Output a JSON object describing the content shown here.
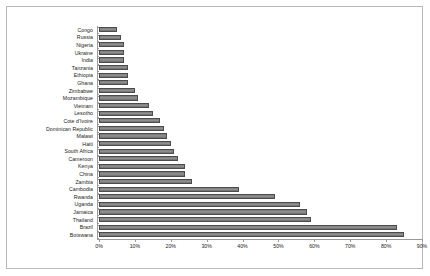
{
  "chart_data": {
    "type": "bar",
    "orientation": "horizontal",
    "title": "",
    "subtitle": "",
    "xlabel": "",
    "ylabel": "",
    "xlim": [
      0,
      90
    ],
    "ylim": null,
    "grid": false,
    "legend": null,
    "tick_suffix": "%",
    "xticks": [
      0,
      10,
      20,
      30,
      40,
      50,
      60,
      70,
      80,
      90
    ],
    "xtick_labels": [
      "0%",
      "10%",
      "20%",
      "30%",
      "40%",
      "50%",
      "60%",
      "70%",
      "80%",
      "90%"
    ],
    "categories": [
      "Congo",
      "Russia",
      "Nigeria",
      "Ukraine",
      "India",
      "Tanzania",
      "Ethiopia",
      "Ghana",
      "Zimbabwe",
      "Mozambique",
      "Vietnam",
      "Lesotho",
      "Cote d'Ivoire",
      "Dominican Republic",
      "Malawi",
      "Haiti",
      "South Africa",
      "Cameroon",
      "Kenya",
      "China",
      "Zambia",
      "Cambodia",
      "Rwanda",
      "Uganda",
      "Jamaica",
      "Thailand",
      "Brazil",
      "Botswana"
    ],
    "values": [
      5,
      6,
      7,
      7,
      7,
      8,
      8,
      8,
      10,
      11,
      14,
      15,
      17,
      18,
      19,
      20,
      21,
      22,
      24,
      24,
      26,
      39,
      49,
      56,
      58,
      59,
      83,
      85
    ],
    "colors": {
      "bar_fill": "#8a8a8a",
      "bar_edge": "#4c4c4c",
      "axis": "#9a9a9a",
      "text": "#1a1a1a",
      "background": "#ffffff",
      "frame": "#b8b8b8"
    }
  }
}
